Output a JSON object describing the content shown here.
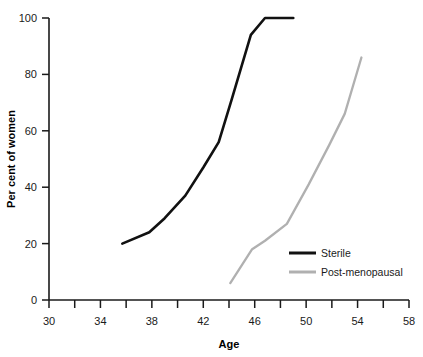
{
  "chart_data": {
    "type": "line",
    "title": "",
    "xlabel": "Age",
    "ylabel": "Per cent of women",
    "xlim": [
      30,
      58
    ],
    "ylim": [
      0,
      100
    ],
    "grid": false,
    "legend_position": "inside-lower-right",
    "x_ticks_major": [
      30,
      34,
      38,
      42,
      46,
      50,
      54,
      58
    ],
    "x_ticks_minor": [
      32,
      36,
      40,
      44,
      48,
      52,
      56
    ],
    "x_tick_labels": [
      "30",
      "34",
      "38",
      "42",
      "46",
      "50",
      "54",
      "58"
    ],
    "y_ticks": [
      0,
      20,
      40,
      60,
      80,
      100
    ],
    "y_tick_labels": [
      "0",
      "20",
      "40",
      "60",
      "80",
      "100"
    ],
    "series": [
      {
        "name": "Sterile",
        "color": "#111111",
        "width": 2.6,
        "x": [
          35.7,
          37.8,
          39.0,
          40.6,
          42.0,
          43.2,
          44.2,
          45.7,
          46.8,
          49.0
        ],
        "values": [
          20,
          24,
          29,
          37,
          47,
          56,
          71,
          94,
          100,
          100
        ]
      },
      {
        "name": "Post-menopausal",
        "color": "#b0b0b0",
        "width": 2.3,
        "x": [
          44.1,
          45.8,
          46.8,
          48.5,
          50.2,
          51.8,
          53.0,
          54.3
        ],
        "values": [
          6,
          18,
          21,
          27,
          41,
          55,
          66,
          86
        ]
      }
    ]
  },
  "legend": {
    "items": [
      {
        "label": "Sterile",
        "color": "#111111"
      },
      {
        "label": "Post-menopausal",
        "color": "#b0b0b0"
      }
    ]
  },
  "axes": {
    "x_title": "Age",
    "y_title": "Per cent of women"
  }
}
